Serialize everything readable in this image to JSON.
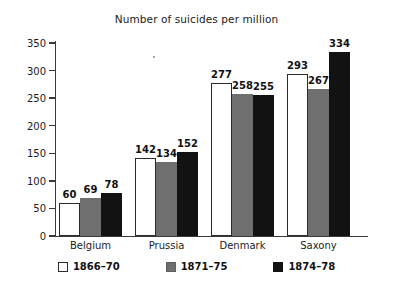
{
  "chart_data": {
    "type": "bar",
    "title": "Number of suicides per million",
    "xlabel": "",
    "ylabel": "",
    "ylim": [
      0,
      350
    ],
    "yticks": [
      0,
      50,
      100,
      150,
      200,
      250,
      300,
      350
    ],
    "grid": false,
    "legend_position": "bottom",
    "categories": [
      "Belgium",
      "Prussia",
      "Denmark",
      "Saxony"
    ],
    "series": [
      {
        "name": "1866–70",
        "color": "#ffffff",
        "values": [
          60,
          142,
          277,
          293
        ]
      },
      {
        "name": "1871–75",
        "color": "#6f6f6f",
        "values": [
          69,
          134,
          258,
          267
        ]
      },
      {
        "name": "1874–78",
        "color": "#121212",
        "values": [
          78,
          152,
          255,
          334
        ]
      }
    ]
  },
  "axis": {
    "tick_labels": [
      "0",
      "50",
      "100",
      "150",
      "200",
      "250",
      "300",
      "350"
    ]
  }
}
